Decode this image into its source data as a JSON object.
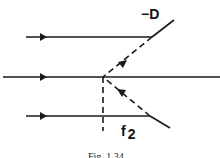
{
  "figure": {
    "labels": {
      "lens_power": "−D",
      "focal_symbol": "f",
      "focal_subscript": "2"
    },
    "caption": "Fig. 1.34",
    "colors": {
      "stroke": "#1a1a1a",
      "background": "#ffffff"
    }
  }
}
